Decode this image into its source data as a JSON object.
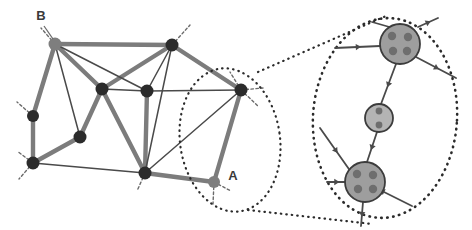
{
  "figure": {
    "background_color": "#ffffff",
    "width": 472,
    "height": 230
  },
  "colors": {
    "thick_edge": "#7c7c7c",
    "thin_edge": "#4a4a4a",
    "dark_node": "#2b2b2b",
    "gray_node": "#7e7e7e",
    "detail_node_fill": "#9e9e9e",
    "detail_node_stroke": "#3c3c3c",
    "detail_small_node_fill": "#b4b4b4",
    "sub_node_fill": "#6e6e6e",
    "dotted_outline": "#2b2b2b",
    "stub_line": "#6a6a6a",
    "label_text": "#3a3a3a"
  },
  "labels": {
    "node_a": "A",
    "node_b": "B"
  },
  "overview_graph": {
    "name": "coarse-graph",
    "nodes": [
      {
        "id": "B",
        "x": 55,
        "y": 44,
        "r": 6.5,
        "kind": "gray"
      },
      {
        "id": "n2",
        "x": 172,
        "y": 45,
        "r": 6.5,
        "kind": "dark"
      },
      {
        "id": "n3",
        "x": 102,
        "y": 89,
        "r": 6.5,
        "kind": "dark"
      },
      {
        "id": "n4",
        "x": 147,
        "y": 91,
        "r": 6.5,
        "kind": "dark"
      },
      {
        "id": "n5",
        "x": 241,
        "y": 90,
        "r": 6.5,
        "kind": "dark"
      },
      {
        "id": "n6",
        "x": 33,
        "y": 116,
        "r": 6.0,
        "kind": "dark"
      },
      {
        "id": "n7",
        "x": 80,
        "y": 137,
        "r": 6.5,
        "kind": "dark"
      },
      {
        "id": "n8",
        "x": 33,
        "y": 163,
        "r": 6.5,
        "kind": "dark"
      },
      {
        "id": "n9",
        "x": 145,
        "y": 173,
        "r": 6.5,
        "kind": "dark"
      },
      {
        "id": "A",
        "x": 214,
        "y": 182,
        "r": 6.0,
        "kind": "gray"
      }
    ],
    "thick_edges": [
      [
        "B",
        "n2"
      ],
      [
        "B",
        "n3"
      ],
      [
        "B",
        "n6"
      ],
      [
        "n2",
        "n5"
      ],
      [
        "n2",
        "n3"
      ],
      [
        "n3",
        "n9"
      ],
      [
        "n4",
        "n9"
      ],
      [
        "n6",
        "n8"
      ],
      [
        "n8",
        "n7"
      ],
      [
        "n7",
        "n3"
      ],
      [
        "n9",
        "A"
      ],
      [
        "A",
        "n5"
      ]
    ],
    "thin_edges": [
      [
        "B",
        "n4"
      ],
      [
        "B",
        "n7"
      ],
      [
        "n2",
        "n4"
      ],
      [
        "n3",
        "n4"
      ],
      [
        "n4",
        "n5"
      ],
      [
        "n2",
        "n9"
      ],
      [
        "n8",
        "n9"
      ],
      [
        "n9",
        "n5"
      ]
    ],
    "boundary_stubs": [
      {
        "from": "B",
        "dx": -14,
        "dy": -16
      },
      {
        "from": "n2",
        "dx": 18,
        "dy": -20
      },
      {
        "from": "n6",
        "dx": -16,
        "dy": -14
      },
      {
        "from": "n8",
        "dx": -16,
        "dy": -12
      },
      {
        "from": "n8",
        "dx": -14,
        "dy": 16
      },
      {
        "from": "n9",
        "dx": -8,
        "dy": 18
      },
      {
        "from": "n5",
        "dx": -11,
        "dy": -18
      },
      {
        "from": "n5",
        "dx": 17,
        "dy": 16
      },
      {
        "from": "n5",
        "dx": 22,
        "dy": -2
      },
      {
        "from": "A",
        "dx": 17,
        "dy": 9
      },
      {
        "from": "A",
        "dx": -1,
        "dy": 22
      }
    ]
  },
  "selection_region": {
    "name": "region-around-A",
    "shape": "dotted-ellipse",
    "cx": 230,
    "cy": 140,
    "rx": 50,
    "ry": 72,
    "rotation_deg": -8,
    "encloses": [
      "A",
      "n5"
    ]
  },
  "magnifier_connectors": {
    "name": "magnifier-cone",
    "upper": {
      "x1": 258,
      "y1": 72,
      "x2": 386,
      "y2": 16
    },
    "lower": {
      "x1": 248,
      "y1": 210,
      "x2": 372,
      "y2": 224
    }
  },
  "detail_region": {
    "name": "magnified-detail",
    "outline": {
      "cx": 385,
      "cy": 118,
      "rx": 72,
      "ry": 100,
      "rotation_deg": 4
    },
    "nodes": [
      {
        "id": "detail-A-top",
        "x": 400,
        "y": 44,
        "r": 20,
        "fill_key": "detail_node_fill",
        "sub_nodes": [
          {
            "dx": -8,
            "dy": -8,
            "r": 4.2
          },
          {
            "dx": 8,
            "dy": -7,
            "r": 4.2
          },
          {
            "dx": -7,
            "dy": 7,
            "r": 4.2
          },
          {
            "dx": 7,
            "dy": 7,
            "r": 4.2
          }
        ]
      },
      {
        "id": "detail-middle",
        "x": 379,
        "y": 118,
        "r": 14,
        "fill_key": "detail_small_node_fill",
        "sub_nodes": [
          {
            "dx": 0,
            "dy": -7,
            "r": 3.4
          },
          {
            "dx": 0,
            "dy": 7,
            "r": 3.4
          }
        ]
      },
      {
        "id": "detail-A-bottom",
        "x": 365,
        "y": 182,
        "r": 20,
        "fill_key": "detail_node_fill",
        "sub_nodes": [
          {
            "dx": -8,
            "dy": -8,
            "r": 4.2
          },
          {
            "dx": 8,
            "dy": -7,
            "r": 4.2
          },
          {
            "dx": -7,
            "dy": 7,
            "r": 4.2
          },
          {
            "dx": 8,
            "dy": 7,
            "r": 4.2
          }
        ]
      }
    ],
    "internal_edges": [
      {
        "x1": 396,
        "y1": 64,
        "x2": 381,
        "y2": 104,
        "arrow": "mid"
      },
      {
        "x1": 377,
        "y1": 132,
        "x2": 367,
        "y2": 162,
        "arrow": "mid"
      }
    ],
    "external_edges": [
      {
        "x1": 335,
        "y1": 48,
        "x2": 380,
        "y2": 46,
        "arrow": "mid"
      },
      {
        "x1": 372,
        "y1": 22,
        "x2": 393,
        "y2": 28,
        "arrow": "none"
      },
      {
        "x1": 418,
        "y1": 27,
        "x2": 438,
        "y2": 18,
        "arrow": "mid"
      },
      {
        "x1": 416,
        "y1": 57,
        "x2": 456,
        "y2": 78,
        "arrow": "mid"
      },
      {
        "x1": 320,
        "y1": 128,
        "x2": 351,
        "y2": 172,
        "arrow": "mid"
      },
      {
        "x1": 327,
        "y1": 182,
        "x2": 346,
        "y2": 182,
        "arrow": "mid"
      },
      {
        "x1": 363,
        "y1": 202,
        "x2": 361,
        "y2": 226,
        "arrow": "mid"
      },
      {
        "x1": 412,
        "y1": 206,
        "x2": 380,
        "y2": 190,
        "arrow": "end"
      }
    ]
  }
}
